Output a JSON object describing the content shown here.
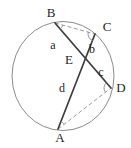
{
  "labels": {
    "B": "B",
    "C": "C",
    "D": "D",
    "A": "A",
    "E": "E",
    "a": "a",
    "b": "b",
    "c": "c",
    "d": "d"
  },
  "colors": {
    "chord": "#3d3d3d",
    "circle": "#8c8c8c",
    "dashed": "#9c9c9c",
    "angle_marks": "#8c8c8c",
    "text": "#1f1f1f",
    "background": "#ffffff"
  }
}
